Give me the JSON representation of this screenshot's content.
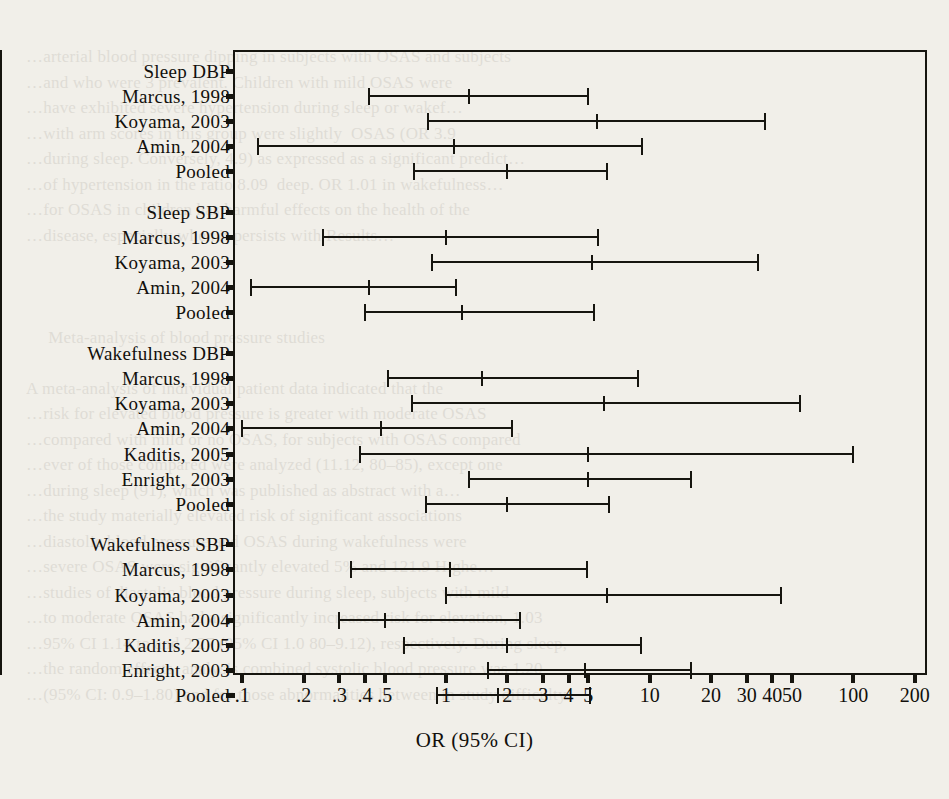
{
  "figure": {
    "xlabel": "OR (95% CI)",
    "scale": "log10",
    "frame": {
      "left_px": 233,
      "right_px": 927,
      "top_px": 50,
      "bottom_px": 675
    },
    "reference_value": 1
  },
  "ghost_text": "…arterial blood pressure dipping in subjects with OSAS and subjects\n…and who were 3 prevalent. Children with mild OSAS were\n…have exhibited severe hypertension during sleep or wakef…\n…with arm scores in this group were slightly  OSAS (OR 3.9\n…during sleep. Conversely, 4.9) as expressed as a significant predict…\n…of hypertension in the ratio 8.09  deep. OR 1.01 in wakefulness…\n…for OSAS in children has harmful effects on the health of the\n…disease, especially when it persists with Results…\n\n\n\n     Meta-analysis of blood pressure studies\n\nA meta-analysis of individual patient data indicated that the\n…risk for elevated blood pressure is greater with moderate OSAS\n…compared with mild or no OSAS, for subjects with OSAS compared\n…ever of those compared were analyzed (11.12, 80–85), except one\n…during sleep (91), which was published as abstract with a…\n…the study materially elevated risk of significant associations\n…diastolic blood pressure and OSAS during wakefulness were\n…severe OSAS were significantly elevated 5% and 121.9 Highe…\n…studies of diastolic blood pressure during sleep, subjects with mild\n…to moderate OSAS had a significantly increased risk for elevation, 1.03\n…95% CI 1.14 to and 2.27 (95% CI 1.0 80–9.12), respectively. During sleep,\n…the random effects  analysis combined systolic blood pressure was 1.20\n…(95% CI: 0.9–1.80) and for those abnormalities between in study difficulty",
  "groups": [
    {
      "id": "sleep-dbp",
      "heading": "Sleep DBP",
      "rows": [
        {
          "label": "Sleep DBP",
          "heading_row": true
        },
        {
          "label": "Marcus, 1998",
          "or": 1.3,
          "lo": 0.42,
          "hi": 5.0
        },
        {
          "label": "Koyama, 2003",
          "or": 5.5,
          "lo": 0.82,
          "hi": 37.0
        },
        {
          "label": "Amin, 2004",
          "or": 1.1,
          "lo": 0.12,
          "hi": 9.2
        },
        {
          "label": "Pooled",
          "or": 2.0,
          "lo": 0.7,
          "hi": 6.2
        }
      ]
    },
    {
      "id": "sleep-sbp",
      "heading": "Sleep SBP",
      "rows": [
        {
          "label": "Sleep SBP",
          "heading_row": true
        },
        {
          "label": "Marcus, 1998",
          "or": 1.0,
          "lo": 0.25,
          "hi": 5.6
        },
        {
          "label": "Koyama, 2003",
          "or": 5.2,
          "lo": 0.85,
          "hi": 34.0
        },
        {
          "label": "Amin, 2004",
          "or": 0.42,
          "lo": 0.11,
          "hi": 1.12
        },
        {
          "label": "Pooled",
          "or": 1.2,
          "lo": 0.4,
          "hi": 5.3
        }
      ]
    },
    {
      "id": "wakefulness-dbp",
      "heading": "Wakefulness DBP",
      "rows": [
        {
          "label": "Wakefulness DBP",
          "heading_row": true
        },
        {
          "label": "Marcus, 1998",
          "or": 1.5,
          "lo": 0.52,
          "hi": 8.8
        },
        {
          "label": "Koyama, 2003",
          "or": 6.0,
          "lo": 0.68,
          "hi": 55.0
        },
        {
          "label": "Amin, 2004",
          "or": 0.48,
          "lo": 0.1,
          "hi": 2.1
        },
        {
          "label": "Kaditis, 2005",
          "or": 5.0,
          "lo": 0.38,
          "hi": 100.0
        },
        {
          "label": "Enright, 2003",
          "or": 5.0,
          "lo": 1.3,
          "hi": 16.0
        },
        {
          "label": "Pooled",
          "or": 2.0,
          "lo": 0.8,
          "hi": 6.3
        }
      ]
    },
    {
      "id": "wakefulness-sbp",
      "heading": "Wakefulness SBP",
      "rows": [
        {
          "label": "Wakefulness SBP",
          "heading_row": true
        },
        {
          "label": "Marcus, 1998",
          "or": 1.05,
          "lo": 0.34,
          "hi": 4.9
        },
        {
          "label": "Koyama, 2003",
          "or": 6.2,
          "lo": 1.0,
          "hi": 44.0
        },
        {
          "label": "Amin, 2004",
          "or": 0.5,
          "lo": 0.3,
          "hi": 2.3
        },
        {
          "label": "Kaditis, 2005",
          "or": 2.0,
          "lo": 0.62,
          "hi": 9.1
        },
        {
          "label": "Enright, 2003",
          "or": 4.8,
          "lo": 1.6,
          "hi": 16.0
        },
        {
          "label": "Pooled",
          "or": 1.8,
          "lo": 0.9,
          "hi": 5.1
        }
      ]
    }
  ],
  "xaxis": {
    "ticks": [
      {
        "value": 0.1,
        "label": ".1",
        "major": true
      },
      {
        "value": 0.2,
        "label": ".2",
        "major": true
      },
      {
        "value": 0.3,
        "label": ".3",
        "major": true
      },
      {
        "value": 0.4,
        "label": ".4",
        "major": true
      },
      {
        "value": 0.5,
        "label": ".5",
        "major": true
      },
      {
        "value": 1,
        "label": "1",
        "major": true
      },
      {
        "value": 2,
        "label": "2",
        "major": true
      },
      {
        "value": 3,
        "label": "3",
        "major": true
      },
      {
        "value": 4,
        "label": "4",
        "major": true
      },
      {
        "value": 5,
        "label": "5",
        "major": true
      },
      {
        "value": 10,
        "label": "10",
        "major": true
      },
      {
        "value": 20,
        "label": "20",
        "major": true
      },
      {
        "value": 30,
        "label": "30",
        "major": true
      },
      {
        "value": 40,
        "label": "40",
        "major": true
      },
      {
        "value": 50,
        "label": "50",
        "major": true
      },
      {
        "value": 100,
        "label": "100",
        "major": true
      },
      {
        "value": 200,
        "label": "200",
        "major": true
      }
    ]
  },
  "chart_data": {
    "type": "forest",
    "title": "",
    "xlabel": "OR (95% CI)",
    "ylabel": "",
    "xscale": "log",
    "xlim": [
      0.09,
      230
    ],
    "reference_line": 1,
    "grid": false,
    "legend": "none",
    "xticks": [
      0.1,
      0.2,
      0.3,
      0.4,
      0.5,
      1,
      2,
      3,
      4,
      5,
      10,
      20,
      30,
      40,
      50,
      100,
      200
    ],
    "xticklabels": [
      ".1",
      ".2",
      ".3",
      ".4",
      ".5",
      "1",
      "2",
      "3",
      "4",
      "5",
      "10",
      "20",
      "30",
      "40",
      "50",
      "100",
      "200"
    ],
    "groups": [
      {
        "name": "Sleep DBP",
        "studies": [
          {
            "study": "Marcus, 1998",
            "or": 1.3,
            "ci_low": 0.42,
            "ci_high": 5.0,
            "pooled": false
          },
          {
            "study": "Koyama, 2003",
            "or": 5.5,
            "ci_low": 0.82,
            "ci_high": 37.0,
            "pooled": false
          },
          {
            "study": "Amin, 2004",
            "or": 1.1,
            "ci_low": 0.12,
            "ci_high": 9.2,
            "pooled": false
          },
          {
            "study": "Pooled",
            "or": 2.0,
            "ci_low": 0.7,
            "ci_high": 6.2,
            "pooled": true
          }
        ]
      },
      {
        "name": "Sleep SBP",
        "studies": [
          {
            "study": "Marcus, 1998",
            "or": 1.0,
            "ci_low": 0.25,
            "ci_high": 5.6,
            "pooled": false
          },
          {
            "study": "Koyama, 2003",
            "or": 5.2,
            "ci_low": 0.85,
            "ci_high": 34.0,
            "pooled": false
          },
          {
            "study": "Amin, 2004",
            "or": 0.42,
            "ci_low": 0.11,
            "ci_high": 1.12,
            "pooled": false
          },
          {
            "study": "Pooled",
            "or": 1.2,
            "ci_low": 0.4,
            "ci_high": 5.3,
            "pooled": true
          }
        ]
      },
      {
        "name": "Wakefulness DBP",
        "studies": [
          {
            "study": "Marcus, 1998",
            "or": 1.5,
            "ci_low": 0.52,
            "ci_high": 8.8,
            "pooled": false
          },
          {
            "study": "Koyama, 2003",
            "or": 6.0,
            "ci_low": 0.68,
            "ci_high": 55.0,
            "pooled": false
          },
          {
            "study": "Amin, 2004",
            "or": 0.48,
            "ci_low": 0.1,
            "ci_high": 2.1,
            "pooled": false
          },
          {
            "study": "Kaditis, 2005",
            "or": 5.0,
            "ci_low": 0.38,
            "ci_high": 100.0,
            "pooled": false
          },
          {
            "study": "Enright, 2003",
            "or": 5.0,
            "ci_low": 1.3,
            "ci_high": 16.0,
            "pooled": false
          },
          {
            "study": "Pooled",
            "or": 2.0,
            "ci_low": 0.8,
            "ci_high": 6.3,
            "pooled": true
          }
        ]
      },
      {
        "name": "Wakefulness SBP",
        "studies": [
          {
            "study": "Marcus, 1998",
            "or": 1.05,
            "ci_low": 0.34,
            "ci_high": 4.9,
            "pooled": false
          },
          {
            "study": "Koyama, 2003",
            "or": 6.2,
            "ci_low": 1.0,
            "ci_high": 44.0,
            "pooled": false
          },
          {
            "study": "Amin, 2004",
            "or": 0.5,
            "ci_low": 0.3,
            "ci_high": 2.3,
            "pooled": false
          },
          {
            "study": "Kaditis, 2005",
            "or": 2.0,
            "ci_low": 0.62,
            "ci_high": 9.1,
            "pooled": false
          },
          {
            "study": "Enright, 2003",
            "or": 4.8,
            "ci_low": 1.6,
            "ci_high": 16.0,
            "pooled": false
          },
          {
            "study": "Pooled",
            "or": 1.8,
            "ci_low": 0.9,
            "ci_high": 5.1,
            "pooled": true
          }
        ]
      }
    ]
  }
}
